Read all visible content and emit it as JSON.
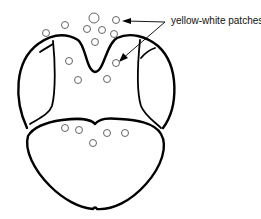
{
  "figure": {
    "annotation": {
      "label": "yellow-white patches",
      "position": {
        "x": 171,
        "y": 12
      }
    },
    "patches": [
      {
        "cx": 94,
        "cy": 18,
        "r": 5
      },
      {
        "cx": 116,
        "cy": 20,
        "r": 3.5
      },
      {
        "cx": 65,
        "cy": 25,
        "r": 3.5
      },
      {
        "cx": 46,
        "cy": 33,
        "r": 3.5
      },
      {
        "cx": 87,
        "cy": 29,
        "r": 3.5
      },
      {
        "cx": 102,
        "cy": 30,
        "r": 3.5
      },
      {
        "cx": 114,
        "cy": 34,
        "r": 3.5
      },
      {
        "cx": 95,
        "cy": 42,
        "r": 3.5
      },
      {
        "cx": 69,
        "cy": 61,
        "r": 3.5
      },
      {
        "cx": 116,
        "cy": 63,
        "r": 3.5
      },
      {
        "cx": 78,
        "cy": 80,
        "r": 3.5
      },
      {
        "cx": 107,
        "cy": 79,
        "r": 3.5
      },
      {
        "cx": 65,
        "cy": 128,
        "r": 3.5
      },
      {
        "cx": 79,
        "cy": 130,
        "r": 3.5
      },
      {
        "cx": 93,
        "cy": 143,
        "r": 3.5
      },
      {
        "cx": 107,
        "cy": 133,
        "r": 3.5
      },
      {
        "cx": 125,
        "cy": 133,
        "r": 3.5
      }
    ],
    "colors": {
      "stroke": "#000000",
      "background": "#ffffff",
      "patch_stroke": "#555555"
    }
  }
}
